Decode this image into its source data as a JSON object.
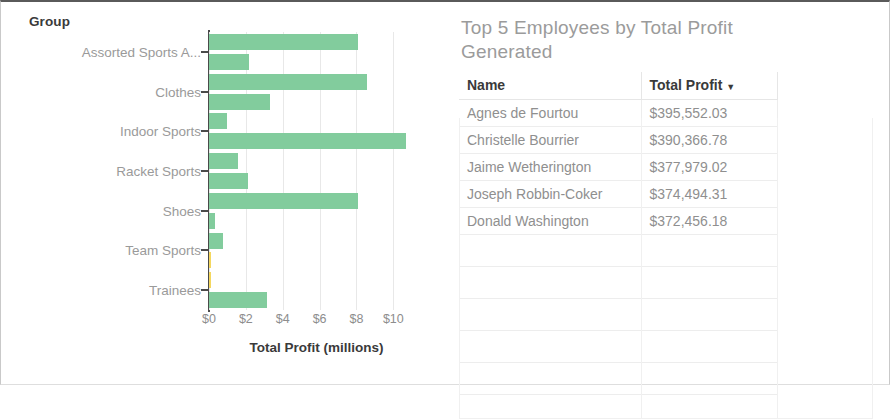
{
  "chart_data": {
    "type": "bar",
    "orientation": "horizontal",
    "title": "",
    "xlabel": "Total Profit (millions)",
    "ylabel": "Group",
    "xlim": [
      0,
      11.5
    ],
    "xticks": [
      "$0",
      "$2",
      "$4",
      "$6",
      "$8",
      "$10"
    ],
    "xtick_values": [
      0,
      2,
      4,
      6,
      8,
      10
    ],
    "grid": true,
    "categories": [
      "Assorted Sports A...",
      "Clothes",
      "Indoor Sports",
      "Racket Sports",
      "Shoes",
      "Team Sports",
      "Trainees"
    ],
    "bars": [
      {
        "value": 8.1,
        "color": "#82cc9d"
      },
      {
        "value": 2.15,
        "color": "#82cc9d"
      },
      {
        "value": 8.55,
        "color": "#82cc9d"
      },
      {
        "value": 3.3,
        "color": "#82cc9d"
      },
      {
        "value": 0.95,
        "color": "#82cc9d"
      },
      {
        "value": 10.7,
        "color": "#82cc9d"
      },
      {
        "value": 1.6,
        "color": "#82cc9d"
      },
      {
        "value": 2.1,
        "color": "#82cc9d"
      },
      {
        "value": 8.1,
        "color": "#82cc9d"
      },
      {
        "value": 0.35,
        "color": "#82cc9d"
      },
      {
        "value": 0.75,
        "color": "#82cc9d"
      },
      {
        "value": 0.12,
        "color": "#f4d75e"
      },
      {
        "value": 0.12,
        "color": "#f4d75e"
      },
      {
        "value": 3.15,
        "color": "#82cc9d"
      }
    ],
    "bar_color": "#82cc9d",
    "highlight_color": "#f4d75e"
  },
  "chart": {
    "group_axis_title": "Group",
    "x_axis_title": "Total Profit (millions)"
  },
  "table_panel": {
    "title": "Top 5 Employees by Total Profit Generated",
    "columns": [
      "Name",
      "Total Profit"
    ],
    "sort_column": "Total Profit",
    "sort_caret": "▼",
    "rows": [
      {
        "name": "Agnes de Fourtou",
        "profit": "$395,552.03"
      },
      {
        "name": "Christelle Bourrier",
        "profit": "$390,366.78"
      },
      {
        "name": "Jaime Wetherington",
        "profit": "$377,979.02"
      },
      {
        "name": "Joseph Robbin-Coker",
        "profit": "$374,494.31"
      },
      {
        "name": "Donald Washington",
        "profit": "$372,456.18"
      }
    ]
  }
}
